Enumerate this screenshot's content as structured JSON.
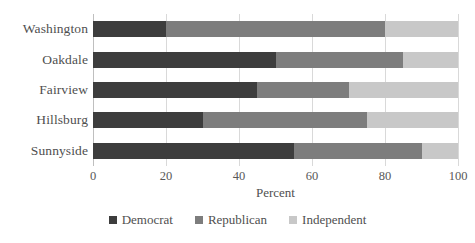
{
  "chart_data": {
    "type": "bar",
    "orientation": "horizontal",
    "stacked": true,
    "title": "",
    "xlabel": "Percent",
    "ylabel": "",
    "xlim": [
      0,
      100
    ],
    "xticks": [
      0,
      20,
      40,
      60,
      80,
      100
    ],
    "grid": true,
    "legend_position": "bottom",
    "categories": [
      "Washington",
      "Oakdale",
      "Fairview",
      "Hillsburg",
      "Sunnyside"
    ],
    "series": [
      {
        "name": "Democrat",
        "color": "#3d3d3d",
        "values": [
          20,
          50,
          45,
          30,
          55
        ]
      },
      {
        "name": "Republican",
        "color": "#7d7d7d",
        "values": [
          60,
          35,
          25,
          45,
          35
        ]
      },
      {
        "name": "Independent",
        "color": "#c8c8c8",
        "values": [
          20,
          15,
          30,
          25,
          10
        ]
      }
    ],
    "cumulative_boundaries": [
      {
        "category": "Washington",
        "democrat_end": 20,
        "republican_end": 80,
        "independent_end": 100
      },
      {
        "category": "Oakdale",
        "democrat_end": 50,
        "republican_end": 85,
        "independent_end": 100
      },
      {
        "category": "Fairview",
        "democrat_end": 45,
        "republican_end": 70,
        "independent_end": 100
      },
      {
        "category": "Hillsburg",
        "democrat_end": 30,
        "republican_end": 75,
        "independent_end": 100
      },
      {
        "category": "Sunnyside",
        "democrat_end": 55,
        "republican_end": 90,
        "independent_end": 100
      }
    ]
  },
  "colors": {
    "democrat": "#3d3d3d",
    "republican": "#7d7d7d",
    "independent": "#c8c8c8",
    "gridline": "#d9d9d9",
    "axis": "#bfbfbf",
    "text": "#4f4f4f",
    "background": "#ffffff"
  }
}
